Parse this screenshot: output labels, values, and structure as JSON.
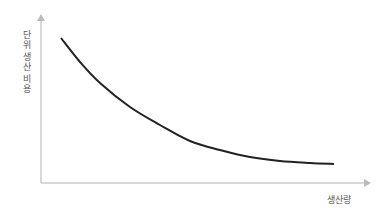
{
  "chart_data": {
    "type": "line",
    "title": "",
    "xlabel": "생산량",
    "ylabel": "단위 생산 비용",
    "ylabel_chars": [
      "단",
      "위",
      " ",
      "생",
      "산",
      " ",
      "비",
      "용"
    ],
    "grid": false,
    "legend": null,
    "xticks": [],
    "yticks": [],
    "series": [
      {
        "name": "단위 생산 비용 곡선",
        "description": "Decreasing convex curve: unit production cost falls as output rises, flattening out",
        "points_px": [
          [
            61,
            38
          ],
          [
            80,
            62
          ],
          [
            100,
            83
          ],
          [
            130,
            107
          ],
          [
            160,
            125
          ],
          [
            190,
            141
          ],
          [
            220,
            150
          ],
          [
            250,
            157
          ],
          [
            280,
            161
          ],
          [
            310,
            163
          ],
          [
            334,
            164
          ]
        ]
      }
    ],
    "colors": {
      "curve": "#222222",
      "axis": "#cccccc",
      "label": "#555555"
    }
  }
}
